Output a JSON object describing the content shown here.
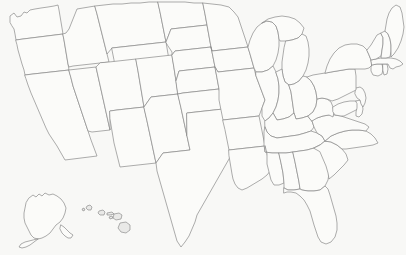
{
  "map": {
    "title": "United States Outline Map",
    "description": "Blank political outline map of the United States showing all 50 state boundaries, with Alaska and Hawaii shown as insets in the lower left.",
    "projection": "albers-usa",
    "width": 406,
    "height": 255,
    "colors": {
      "background": "#f8f8f6",
      "state_fill": "#fbfbf9",
      "state_border": "#8a8a8a",
      "island_fill": "#e9e9e7"
    },
    "labels_visible": false,
    "legend_visible": false,
    "contiguous_state_count": 48,
    "inset_count": 2,
    "total_state_count": 50,
    "insets": [
      {
        "name": "Alaska",
        "code": "AK",
        "position": "lower-left"
      },
      {
        "name": "Hawaii",
        "code": "HI",
        "position": "lower-left-center"
      }
    ],
    "states": [
      {
        "code": "WA",
        "name": "Washington",
        "region": "West"
      },
      {
        "code": "OR",
        "name": "Oregon",
        "region": "West"
      },
      {
        "code": "CA",
        "name": "California",
        "region": "West"
      },
      {
        "code": "NV",
        "name": "Nevada",
        "region": "West"
      },
      {
        "code": "ID",
        "name": "Idaho",
        "region": "West"
      },
      {
        "code": "MT",
        "name": "Montana",
        "region": "West"
      },
      {
        "code": "WY",
        "name": "Wyoming",
        "region": "West"
      },
      {
        "code": "UT",
        "name": "Utah",
        "region": "West"
      },
      {
        "code": "AZ",
        "name": "Arizona",
        "region": "West"
      },
      {
        "code": "CO",
        "name": "Colorado",
        "region": "West"
      },
      {
        "code": "NM",
        "name": "New Mexico",
        "region": "West"
      },
      {
        "code": "ND",
        "name": "North Dakota",
        "region": "Midwest"
      },
      {
        "code": "SD",
        "name": "South Dakota",
        "region": "Midwest"
      },
      {
        "code": "NE",
        "name": "Nebraska",
        "region": "Midwest"
      },
      {
        "code": "KS",
        "name": "Kansas",
        "region": "Midwest"
      },
      {
        "code": "OK",
        "name": "Oklahoma",
        "region": "South"
      },
      {
        "code": "TX",
        "name": "Texas",
        "region": "South"
      },
      {
        "code": "MN",
        "name": "Minnesota",
        "region": "Midwest"
      },
      {
        "code": "IA",
        "name": "Iowa",
        "region": "Midwest"
      },
      {
        "code": "MO",
        "name": "Missouri",
        "region": "Midwest"
      },
      {
        "code": "AR",
        "name": "Arkansas",
        "region": "South"
      },
      {
        "code": "LA",
        "name": "Louisiana",
        "region": "South"
      },
      {
        "code": "WI",
        "name": "Wisconsin",
        "region": "Midwest"
      },
      {
        "code": "IL",
        "name": "Illinois",
        "region": "Midwest"
      },
      {
        "code": "MI",
        "name": "Michigan",
        "region": "Midwest"
      },
      {
        "code": "IN",
        "name": "Indiana",
        "region": "Midwest"
      },
      {
        "code": "OH",
        "name": "Ohio",
        "region": "Midwest"
      },
      {
        "code": "KY",
        "name": "Kentucky",
        "region": "South"
      },
      {
        "code": "TN",
        "name": "Tennessee",
        "region": "South"
      },
      {
        "code": "MS",
        "name": "Mississippi",
        "region": "South"
      },
      {
        "code": "AL",
        "name": "Alabama",
        "region": "South"
      },
      {
        "code": "GA",
        "name": "Georgia",
        "region": "South"
      },
      {
        "code": "FL",
        "name": "Florida",
        "region": "South"
      },
      {
        "code": "SC",
        "name": "South Carolina",
        "region": "South"
      },
      {
        "code": "NC",
        "name": "North Carolina",
        "region": "South"
      },
      {
        "code": "VA",
        "name": "Virginia",
        "region": "South"
      },
      {
        "code": "WV",
        "name": "West Virginia",
        "region": "South"
      },
      {
        "code": "MD",
        "name": "Maryland",
        "region": "Northeast"
      },
      {
        "code": "DE",
        "name": "Delaware",
        "region": "Northeast"
      },
      {
        "code": "NJ",
        "name": "New Jersey",
        "region": "Northeast"
      },
      {
        "code": "PA",
        "name": "Pennsylvania",
        "region": "Northeast"
      },
      {
        "code": "NY",
        "name": "New York",
        "region": "Northeast"
      },
      {
        "code": "CT",
        "name": "Connecticut",
        "region": "Northeast"
      },
      {
        "code": "RI",
        "name": "Rhode Island",
        "region": "Northeast"
      },
      {
        "code": "MA",
        "name": "Massachusetts",
        "region": "Northeast"
      },
      {
        "code": "VT",
        "name": "Vermont",
        "region": "Northeast"
      },
      {
        "code": "NH",
        "name": "New Hampshire",
        "region": "Northeast"
      },
      {
        "code": "ME",
        "name": "Maine",
        "region": "Northeast"
      }
    ],
    "hawaii_islands": [
      {
        "name": "Niihau"
      },
      {
        "name": "Kauai"
      },
      {
        "name": "Oahu"
      },
      {
        "name": "Molokai"
      },
      {
        "name": "Lanai"
      },
      {
        "name": "Maui"
      },
      {
        "name": "Hawaii"
      }
    ]
  }
}
